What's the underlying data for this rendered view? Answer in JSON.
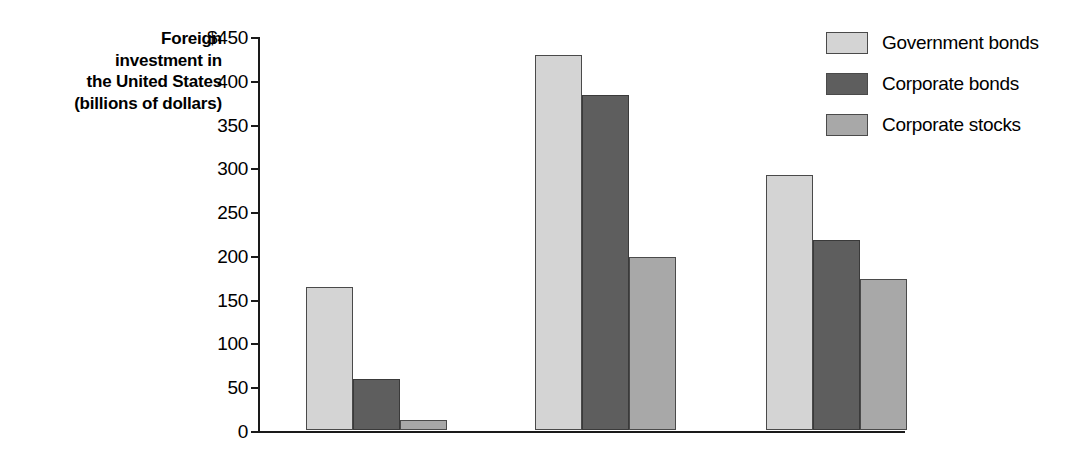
{
  "chart_data": {
    "type": "bar",
    "title": "",
    "xlabel": "",
    "ylabel": "Foreign investment in the United States (billions of dollars)",
    "ylabel_lines": [
      "Foreign",
      "investment in",
      "the United States",
      "(billions of dollars)"
    ],
    "categories": [
      "1995",
      "2007",
      "2014"
    ],
    "series": [
      {
        "name": "Government bonds",
        "color": "#d4d4d4",
        "values": [
          163,
          428,
          291
        ]
      },
      {
        "name": "Corporate bonds",
        "color": "#5e5e5e",
        "values": [
          58,
          383,
          217
        ]
      },
      {
        "name": "Corporate stocks",
        "color": "#a8a8a8",
        "values": [
          12,
          198,
          172
        ]
      }
    ],
    "ylim": [
      0,
      450
    ],
    "ytick_values": [
      0,
      50,
      100,
      150,
      200,
      250,
      300,
      350,
      400,
      450
    ],
    "ytick_labels": [
      "0",
      "50",
      "100",
      "150",
      "200",
      "250",
      "300",
      "350",
      "400",
      "$450"
    ],
    "grid": false,
    "legend_position": "top-right",
    "units": "billions of dollars"
  },
  "legend": {
    "items": [
      {
        "label": "Government bonds",
        "swatch": "#d4d4d4"
      },
      {
        "label": "Corporate bonds",
        "swatch": "#5e5e5e"
      },
      {
        "label": "Corporate stocks",
        "swatch": "#a8a8a8"
      }
    ]
  }
}
